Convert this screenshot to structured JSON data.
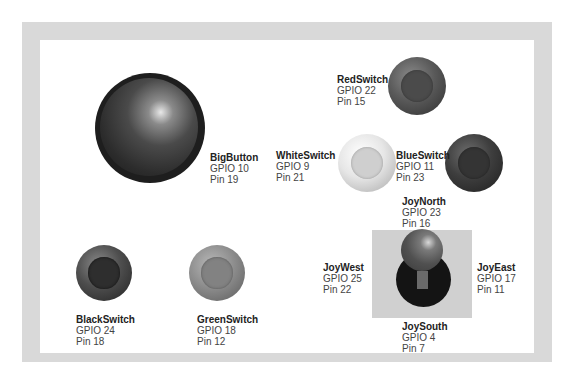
{
  "colors": {
    "frame": "#d9d9d9",
    "panel": "#ffffff",
    "joystick_box": "#d0d0d0"
  },
  "controls": {
    "big_button": {
      "name": "BigButton",
      "gpio": "GPIO 10",
      "pin": "Pin 19"
    },
    "red_switch": {
      "name": "RedSwitch",
      "gpio": "GPIO 22",
      "pin": "Pin 15"
    },
    "white_switch": {
      "name": "WhiteSwitch",
      "gpio": "GPIO 9",
      "pin": "Pin 21"
    },
    "blue_switch": {
      "name": "BlueSwitch",
      "gpio": "GPIO 11",
      "pin": "Pin 23"
    },
    "black_switch": {
      "name": "BlackSwitch",
      "gpio": "GPIO 24",
      "pin": "Pin 18"
    },
    "green_switch": {
      "name": "GreenSwitch",
      "gpio": "GPIO 18",
      "pin": "Pin 12"
    },
    "joy_north": {
      "name": "JoyNorth",
      "gpio": "GPIO 23",
      "pin": "Pin 16"
    },
    "joy_west": {
      "name": "JoyWest",
      "gpio": "GPIO 25",
      "pin": "Pin 22"
    },
    "joy_east": {
      "name": "JoyEast",
      "gpio": "GPIO 17",
      "pin": "Pin 11"
    },
    "joy_south": {
      "name": "JoySouth",
      "gpio": "GPIO 4",
      "pin": "Pin 7"
    }
  }
}
